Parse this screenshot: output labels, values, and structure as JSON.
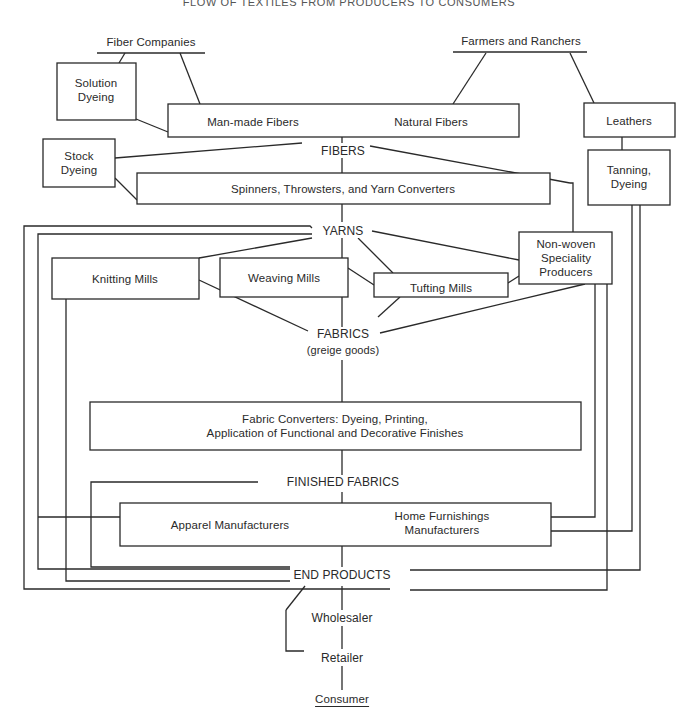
{
  "diagram": {
    "title": "FLOW OF TEXTILES FROM PRODUCERS TO CONSUMERS",
    "sources": {
      "fiber_companies": "Fiber Companies",
      "farmers_ranchers": "Farmers and Ranchers"
    },
    "boxes": {
      "solution_dyeing": [
        "Solution",
        "Dyeing"
      ],
      "man_made_fibers": "Man-made Fibers",
      "natural_fibers": "Natural Fibers",
      "leathers": "Leathers",
      "tanning_dyeing": [
        "Tanning,",
        "Dyeing"
      ],
      "stock_dyeing": [
        "Stock",
        "Dyeing"
      ],
      "spinners": "Spinners, Throwsters, and Yarn Converters",
      "knitting_mills": "Knitting Mills",
      "weaving_mills": "Weaving Mills",
      "tufting_mills": "Tufting Mills",
      "non_woven": [
        "Non-woven",
        "Speciality",
        "Producers"
      ],
      "fabric_converters": [
        "Fabric Converters:  Dyeing, Printing,",
        "Application of Functional and Decorative Finishes"
      ],
      "apparel_manufacturers": "Apparel Manufacturers",
      "home_furnishings": [
        "Home Furnishings",
        "Manufacturers"
      ]
    },
    "stages": {
      "fibers": "FIBERS",
      "yarns": "YARNS",
      "fabrics": "FABRICS",
      "fabrics_note": "(greige goods)",
      "finished_fabrics": "FINISHED FABRICS",
      "end_products": "END PRODUCTS"
    },
    "distribution": {
      "wholesaler": "Wholesaler",
      "retailer": "Retailer",
      "consumer": "Consumer"
    },
    "colors": {
      "line": "#2a2a2a",
      "background": "#ffffff"
    }
  }
}
